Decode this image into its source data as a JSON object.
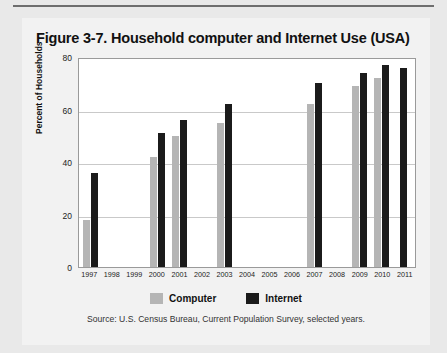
{
  "figure": {
    "title": "Figure 3-7. Household computer and Internet Use (USA)",
    "source": "Source: U.S. Census Bureau, Current Population Survey, selected years."
  },
  "legend": {
    "items": [
      {
        "label": "Computer",
        "color": "#b5b5b5",
        "swatch": "computer-swatch"
      },
      {
        "label": "Internet",
        "color": "#1b1b1b",
        "swatch": "internet-swatch"
      }
    ]
  },
  "chart_data": {
    "type": "bar",
    "title": "Figure 3-7. Household computer and Internet Use (USA)",
    "xlabel": "",
    "ylabel": "Percent of Households",
    "ylim": [
      0,
      80
    ],
    "yticks": [
      0,
      20,
      40,
      60,
      80
    ],
    "ytick_labels": [
      "0",
      "20",
      "40",
      "60",
      "80"
    ],
    "grid": true,
    "legend_position": "bottom",
    "categories": [
      "1997",
      "1998",
      "1999",
      "2000",
      "2001",
      "2002",
      "2003",
      "2004",
      "2005",
      "2006",
      "2007",
      "2008",
      "2009",
      "2010",
      "2011"
    ],
    "series": [
      {
        "name": "Computer",
        "color": "#b5b5b5",
        "values": [
          18,
          null,
          null,
          42,
          50,
          null,
          55,
          null,
          null,
          null,
          62,
          null,
          69,
          72,
          null
        ]
      },
      {
        "name": "Internet",
        "color": "#1b1b1b",
        "values": [
          36,
          null,
          null,
          51,
          56,
          null,
          62,
          null,
          null,
          null,
          70,
          null,
          74,
          77,
          76
        ]
      }
    ]
  }
}
